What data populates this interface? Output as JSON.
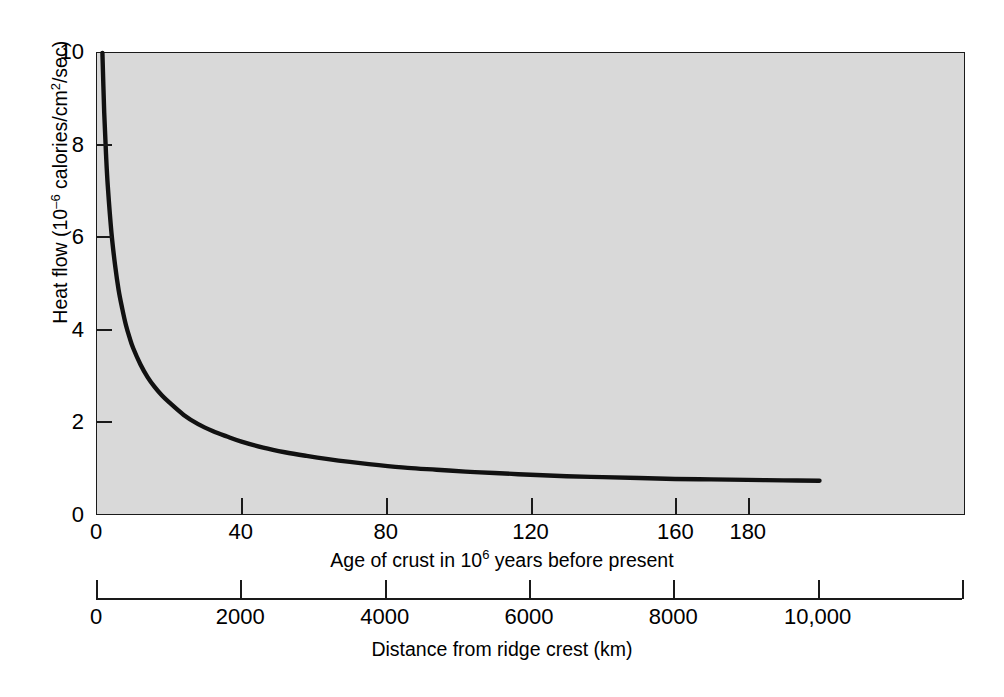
{
  "figure": {
    "background_color": "#ffffff",
    "plot_background_color": "#d9d9d9",
    "axis_color": "#1a1a1a",
    "curve_color": "#111111"
  },
  "chart_data": {
    "type": "line",
    "title": "",
    "subtitle": "",
    "xlabel": "Age of crust in 10⁶ years before present",
    "xlabel_secondary": "Distance from ridge crest (km)",
    "ylabel": "Heat flow (10⁻⁶ calories/cm²/sec)",
    "xlim": [
      0,
      240
    ],
    "ylim": [
      0,
      10
    ],
    "xlim_secondary": [
      0,
      12000
    ],
    "grid": false,
    "legend": null,
    "xticks": [
      0,
      40,
      80,
      120,
      160,
      180
    ],
    "xticklabels": [
      "0",
      "40",
      "80",
      "120",
      "160",
      "180"
    ],
    "xticks_secondary": [
      0,
      2000,
      4000,
      6000,
      8000,
      10000
    ],
    "xticklabels_secondary": [
      "0",
      "2000",
      "4000",
      "6000",
      "8000",
      "10,000"
    ],
    "yticks": [
      0,
      2,
      4,
      6,
      8,
      10
    ],
    "yticklabels": [
      "0",
      "2",
      "4",
      "6",
      "8",
      "10"
    ],
    "series": [
      {
        "name": "Heat flow vs age of oceanic crust",
        "x": [
          1.5,
          2,
          2.5,
          3,
          4,
          5,
          6,
          7,
          8,
          9,
          10,
          12,
          14,
          16,
          18,
          20,
          24,
          28,
          32,
          36,
          40,
          46,
          52,
          58,
          64,
          70,
          78,
          86,
          94,
          102,
          110,
          120,
          130,
          140,
          150,
          160,
          170,
          180,
          190,
          200
        ],
        "y": [
          10.0,
          8.7,
          7.8,
          7.1,
          6.1,
          5.4,
          4.85,
          4.45,
          4.1,
          3.83,
          3.6,
          3.25,
          2.97,
          2.75,
          2.57,
          2.42,
          2.15,
          1.95,
          1.8,
          1.68,
          1.57,
          1.44,
          1.34,
          1.26,
          1.19,
          1.13,
          1.06,
          1.0,
          0.96,
          0.92,
          0.89,
          0.85,
          0.82,
          0.8,
          0.78,
          0.76,
          0.75,
          0.74,
          0.73,
          0.72
        ]
      }
    ],
    "annotations": []
  },
  "axes": {
    "y": {
      "title": "Heat flow (10",
      "title_sup": "–6",
      "title_rest": " calories/cm",
      "title_sup2": "2",
      "title_end": "/sec)",
      "ticks": [
        {
          "label": "0",
          "value": 0
        },
        {
          "label": "2",
          "value": 2
        },
        {
          "label": "4",
          "value": 4
        },
        {
          "label": "6",
          "value": 6
        },
        {
          "label": "8",
          "value": 8
        },
        {
          "label": "10",
          "value": 10
        }
      ]
    },
    "x_age": {
      "title_pre": "Age of crust in 10",
      "title_sup": "6",
      "title_post": " years before present",
      "ticks": [
        {
          "label": "0",
          "value": 0
        },
        {
          "label": "40",
          "value": 40
        },
        {
          "label": "80",
          "value": 80
        },
        {
          "label": "120",
          "value": 120
        },
        {
          "label": "160",
          "value": 160
        },
        {
          "label": "180",
          "value": 180
        }
      ]
    },
    "x_distance": {
      "title": "Distance from ridge crest (km)",
      "ticks": [
        {
          "label": "0",
          "value": 0
        },
        {
          "label": "2000",
          "value": 2000
        },
        {
          "label": "4000",
          "value": 4000
        },
        {
          "label": "6000",
          "value": 6000
        },
        {
          "label": "8000",
          "value": 8000
        },
        {
          "label": "10,000",
          "value": 10000
        }
      ]
    }
  }
}
